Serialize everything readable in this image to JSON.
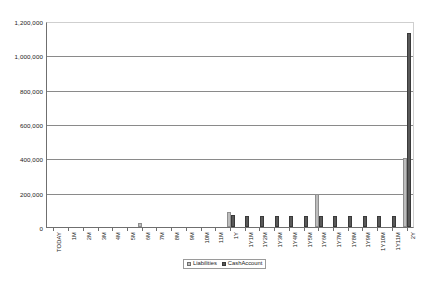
{
  "chart_data": {
    "type": "bar",
    "title": "",
    "subtitle": "",
    "xlabel": "",
    "ylabel": "",
    "ylim": [
      0,
      1200000
    ],
    "ytick_values": [
      0,
      200000,
      400000,
      600000,
      800000,
      1000000,
      1200000
    ],
    "ytick_labels": [
      "0",
      "200,000",
      "400,000",
      "600,000",
      "800,000",
      "1,000,000",
      "1,200,000"
    ],
    "grid": "horizontal",
    "legend_position": "bottom-center",
    "categories": [
      "TODAY",
      "1M",
      "2M",
      "3M",
      "4M",
      "5M",
      "6M",
      "7M",
      "8M",
      "9M",
      "10M",
      "11M",
      "1Y",
      "1Y1M",
      "1Y2M",
      "1Y3M",
      "1Y4M",
      "1Y5M",
      "1Y6M",
      "1Y7M",
      "1Y8M",
      "1Y9M",
      "1Y10M",
      "1Y11M",
      "2Y"
    ],
    "series": [
      {
        "name": "Liabilities",
        "color": "#bdbdbd",
        "values": [
          0,
          0,
          0,
          0,
          0,
          0,
          25000,
          0,
          0,
          0,
          0,
          0,
          90000,
          0,
          0,
          0,
          0,
          0,
          195000,
          0,
          0,
          0,
          0,
          0,
          400000
        ]
      },
      {
        "name": "CashAccount",
        "color": "#595959",
        "values": [
          0,
          0,
          0,
          0,
          0,
          0,
          0,
          0,
          0,
          0,
          0,
          0,
          72000,
          62000,
          62000,
          62000,
          62000,
          62000,
          62000,
          62000,
          62000,
          62000,
          62000,
          62000,
          1130000
        ]
      }
    ]
  },
  "legend": {
    "items": [
      {
        "label": "Liabilities"
      },
      {
        "label": "CashAccount"
      }
    ]
  }
}
